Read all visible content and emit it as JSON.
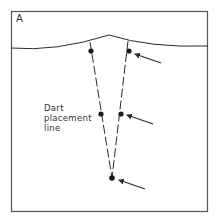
{
  "figure": {
    "panel_letter": "A",
    "label_lines": [
      "Dart",
      "placement",
      "line"
    ],
    "colors": {
      "stroke": "#2a2a2a",
      "frame": "#555555",
      "background": "#ffffff"
    },
    "dart": {
      "apex": [
        112,
        178
      ],
      "left_leg_top": [
        90,
        42
      ],
      "right_leg_top": [
        128,
        41
      ],
      "dots": [
        {
          "id": "left-top",
          "pos": [
            91,
            51
          ]
        },
        {
          "id": "right-top",
          "pos": [
            129,
            51
          ]
        },
        {
          "id": "left-mid",
          "pos": [
            101,
            114
          ]
        },
        {
          "id": "right-mid",
          "pos": [
            121,
            114
          ]
        },
        {
          "id": "apex",
          "pos": [
            112,
            178
          ]
        }
      ],
      "arrows": [
        {
          "id": "arrow-top",
          "tail": [
            161,
            63
          ],
          "tip": [
            135,
            54
          ]
        },
        {
          "id": "arrow-mid",
          "tail": [
            153,
            124
          ],
          "tip": [
            127,
            115
          ]
        },
        {
          "id": "arrow-bottom",
          "tail": [
            145,
            189
          ],
          "tip": [
            119,
            180
          ]
        }
      ]
    }
  }
}
